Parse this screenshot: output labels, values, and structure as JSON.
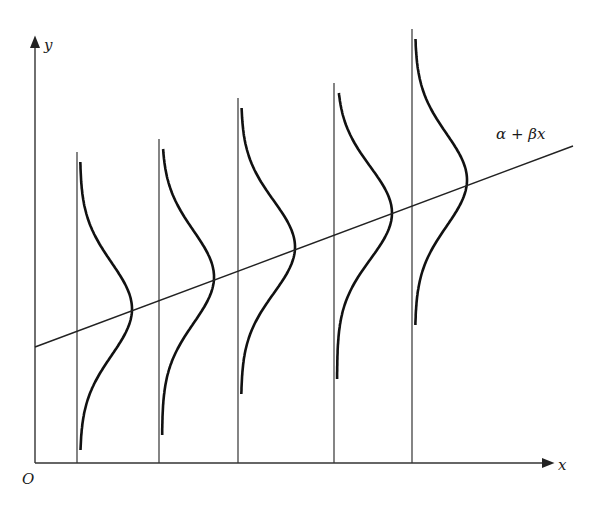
{
  "diagram": {
    "labels": {
      "y_axis": "y",
      "x_axis": "x",
      "origin": "O",
      "line": "α + βx"
    },
    "colors": {
      "ink": "#1a1a1a",
      "axis": "#333333",
      "background": "#ffffff"
    }
  },
  "chart_data": {
    "type": "diagram",
    "line": {
      "label": "α + βx",
      "x0": 35,
      "y0": 347,
      "x1": 573,
      "y1": 146
    },
    "distributions": [
      {
        "x": 77,
        "top": 162,
        "bottom": 450,
        "peak_y": 309,
        "peak_x": 132
      },
      {
        "x": 159,
        "top": 149,
        "bottom": 436,
        "peak_y": 277,
        "peak_x": 214
      },
      {
        "x": 238,
        "top": 108,
        "bottom": 395,
        "peak_y": 247,
        "peak_x": 295
      },
      {
        "x": 334,
        "top": 93,
        "bottom": 380,
        "peak_y": 213,
        "peak_x": 392
      },
      {
        "x": 412,
        "top": 39,
        "bottom": 326,
        "peak_y": 180,
        "peak_x": 467
      }
    ]
  }
}
